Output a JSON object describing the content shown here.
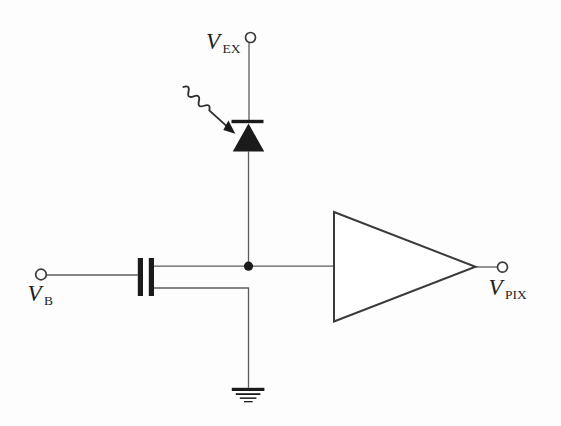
{
  "labels": {
    "vex_base": "V",
    "vex_sub": "EX",
    "vb_base": "V",
    "vb_sub": "B",
    "vpix_base": "V",
    "vpix_sub": "PIX"
  },
  "colors": {
    "background": "#fdfdfd",
    "wire": "#5c5c5c",
    "component_fill": "#1b1b1b",
    "outline_stroke": "#3a3a3a"
  },
  "icons": {
    "terminal": "open-circle",
    "sense_node": "filled-dot",
    "photodiode": "filled-triangle-with-cathode-bar",
    "incident_light": "wavy-arrow",
    "capacitor_plates": "two-thick-vertical-bars",
    "amplifier": "right-pointing-triangle",
    "ground": "stacked-horizontal-bars"
  }
}
